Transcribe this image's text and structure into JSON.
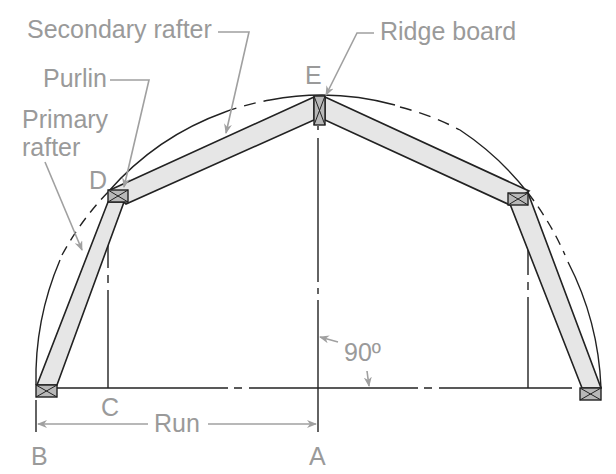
{
  "labels": {
    "secondary_rafter": "Secondary rafter",
    "purlin": "Purlin",
    "primary_rafter_line1": "Primary",
    "primary_rafter_line2": "rafter",
    "ridge_board": "Ridge board",
    "point_e": "E",
    "point_d": "D",
    "point_c": "C",
    "point_b": "B",
    "point_a": "A",
    "run": "Run",
    "angle": "90º"
  },
  "colors": {
    "label_gray": "#9a9a9a",
    "rafter_fill": "#e6e6e6",
    "block_fill": "#b8b8b8",
    "line": "#222222"
  }
}
